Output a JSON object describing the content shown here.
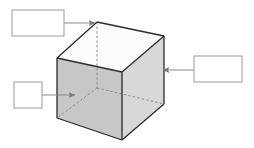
{
  "figure": {
    "background_color": "#ffffff",
    "width": 254,
    "height": 148
  },
  "cube": {
    "name": "cube",
    "description": "Transparent rectangular cube in oblique projection with hidden edges dashed",
    "colors": {
      "top_face": "#fbfbfb",
      "left_front_face": "#c9c9c9",
      "right_front_face": "#d6d6d6",
      "bottom_inner_face": "#d0d0d0",
      "visible_edge": "#2a2a2a",
      "hidden_edge": "#8c8c8c",
      "outline": "#333333"
    },
    "vertices": {
      "top_back": "97,22",
      "top_left": "57,58",
      "top_right": "164,36",
      "top_front": "122,72",
      "bottom_back": "97,88",
      "bottom_left": "57,118",
      "bottom_right": "164,104",
      "bottom_front": "122,140"
    },
    "edges_visible": 9,
    "edges_hidden": 3
  },
  "callouts": [
    {
      "id": "callout-top-left",
      "name": "label-box-top-left",
      "text": "",
      "x": 12,
      "y": 10,
      "width": 52,
      "height": 26,
      "arrow": {
        "name": "arrow-to-top-back-vertex",
        "from": "64,23",
        "to": "96,23",
        "direction": "right",
        "target": "top-back-vertex"
      }
    },
    {
      "id": "callout-left",
      "name": "label-box-left",
      "text": "",
      "x": 14,
      "y": 82,
      "width": 28,
      "height": 26,
      "arrow": {
        "name": "arrow-to-hidden-edge",
        "from": "42,95",
        "to": "74,95",
        "direction": "right",
        "target": "hidden-interior-edge"
      }
    },
    {
      "id": "callout-right",
      "name": "label-box-right",
      "text": "",
      "x": 194,
      "y": 56,
      "width": 48,
      "height": 26,
      "arrow": {
        "name": "arrow-to-right-face",
        "from": "194,70",
        "to": "162,70",
        "direction": "left",
        "target": "right-front-face"
      }
    }
  ],
  "box_style": {
    "fill": "#ffffff",
    "stroke": "#9a9a9a",
    "stroke_width": 1
  },
  "arrow_style": {
    "stroke": "#8a8a8a",
    "stroke_width": 1,
    "head_color": "#7a7a7a"
  }
}
